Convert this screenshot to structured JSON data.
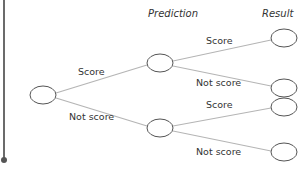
{
  "diagram": {
    "type": "decision-tree",
    "headers": {
      "prediction": "Prediction",
      "result": "Result"
    },
    "edges": {
      "root_to_top": "Score",
      "root_to_bottom": "Not score",
      "top_to_r1": "Score",
      "top_to_r2": "Not score",
      "bottom_to_r3": "Score",
      "bottom_to_r4": "Not score"
    },
    "colors": {
      "node_stroke": "#555555",
      "edge": "#b5b5b5",
      "text": "#333333",
      "side_rule": "#6b6b6b"
    }
  }
}
